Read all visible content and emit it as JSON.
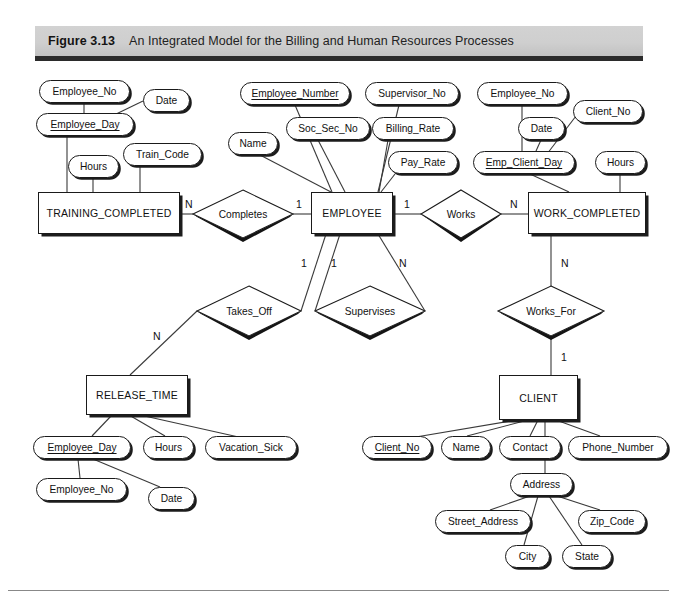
{
  "figure": {
    "number_label": "Figure 3.13",
    "title": "An Integrated Model for the Billing and Human Resources Processes"
  },
  "diagram": {
    "type": "entity-relationship-diagram",
    "entities": [
      {
        "id": "training_completed",
        "label": "TRAINING_COMPLETED",
        "x": 38,
        "y": 192,
        "w": 142,
        "h": 42
      },
      {
        "id": "employee",
        "label": "EMPLOYEE",
        "x": 311,
        "y": 192,
        "w": 82,
        "h": 42
      },
      {
        "id": "work_completed",
        "label": "WORK_COMPLETED",
        "x": 528,
        "y": 192,
        "w": 118,
        "h": 42
      },
      {
        "id": "release_time",
        "label": "RELEASE_TIME",
        "x": 86,
        "y": 375,
        "w": 102,
        "h": 40
      },
      {
        "id": "client",
        "label": "CLIENT",
        "x": 499,
        "y": 375,
        "w": 79,
        "h": 45
      }
    ],
    "relationships": [
      {
        "id": "completes",
        "label": "Completes",
        "cx": 243,
        "cy": 214,
        "rx": 50,
        "ry": 24
      },
      {
        "id": "works",
        "label": "Works",
        "cx": 461,
        "cy": 214,
        "rx": 40,
        "ry": 24
      },
      {
        "id": "takes_off",
        "label": "Takes_Off",
        "cx": 249,
        "cy": 311,
        "rx": 52,
        "ry": 25
      },
      {
        "id": "supervises",
        "label": "Supervises",
        "cx": 370,
        "cy": 311,
        "rx": 55,
        "ry": 25
      },
      {
        "id": "works_for",
        "label": "Works_For",
        "cx": 551,
        "cy": 311,
        "rx": 53,
        "ry": 25
      }
    ],
    "attributes": [
      {
        "id": "tc_employee_no",
        "label": "Employee_No",
        "key": false,
        "x": 39,
        "y": 80,
        "w": 91,
        "h": 23
      },
      {
        "id": "tc_date",
        "label": "Date",
        "key": false,
        "x": 143,
        "y": 89,
        "w": 47,
        "h": 23
      },
      {
        "id": "tc_employee_day",
        "label": "Employee_Day",
        "key": true,
        "x": 36,
        "y": 113,
        "w": 98,
        "h": 23
      },
      {
        "id": "tc_hours",
        "label": "Hours",
        "key": false,
        "x": 68,
        "y": 155,
        "w": 51,
        "h": 23
      },
      {
        "id": "tc_train_code",
        "label": "Train_Code",
        "key": false,
        "x": 123,
        "y": 143,
        "w": 79,
        "h": 23
      },
      {
        "id": "emp_employee_number",
        "label": "Employee_Number",
        "key": true,
        "x": 240,
        "y": 82,
        "w": 110,
        "h": 23
      },
      {
        "id": "emp_soc_sec_no",
        "label": "Soc_Sec_No",
        "key": false,
        "x": 286,
        "y": 117,
        "w": 84,
        "h": 23
      },
      {
        "id": "emp_name",
        "label": "Name",
        "key": false,
        "x": 228,
        "y": 132,
        "w": 50,
        "h": 23
      },
      {
        "id": "emp_supervisor_no",
        "label": "Supervisor_No",
        "key": false,
        "x": 365,
        "y": 82,
        "w": 94,
        "h": 23
      },
      {
        "id": "emp_billing_rate",
        "label": "Billing_Rate",
        "key": false,
        "x": 372,
        "y": 117,
        "w": 82,
        "h": 23
      },
      {
        "id": "emp_pay_rate",
        "label": "Pay_Rate",
        "key": false,
        "x": 388,
        "y": 151,
        "w": 70,
        "h": 23
      },
      {
        "id": "wc_employee_no",
        "label": "Employee_No",
        "key": false,
        "x": 477,
        "y": 82,
        "w": 91,
        "h": 23
      },
      {
        "id": "wc_date",
        "label": "Date",
        "key": false,
        "x": 518,
        "y": 117,
        "w": 47,
        "h": 23
      },
      {
        "id": "wc_client_no",
        "label": "Client_No",
        "key": false,
        "x": 573,
        "y": 100,
        "w": 70,
        "h": 23
      },
      {
        "id": "wc_emp_client_day",
        "label": "Emp_Client_Day",
        "key": true,
        "x": 473,
        "y": 151,
        "w": 102,
        "h": 23
      },
      {
        "id": "wc_hours",
        "label": "Hours",
        "key": false,
        "x": 595,
        "y": 151,
        "w": 51,
        "h": 23
      },
      {
        "id": "rt_employee_day",
        "label": "Employee_Day",
        "key": true,
        "x": 33,
        "y": 436,
        "w": 98,
        "h": 23
      },
      {
        "id": "rt_hours",
        "label": "Hours",
        "key": false,
        "x": 143,
        "y": 436,
        "w": 51,
        "h": 23
      },
      {
        "id": "rt_vacation_sick",
        "label": "Vacation_Sick",
        "key": false,
        "x": 205,
        "y": 436,
        "w": 92,
        "h": 23
      },
      {
        "id": "rt_employee_no",
        "label": "Employee_No",
        "key": false,
        "x": 36,
        "y": 478,
        "w": 91,
        "h": 23
      },
      {
        "id": "rt_date",
        "label": "Date",
        "key": false,
        "x": 148,
        "y": 487,
        "w": 47,
        "h": 23
      },
      {
        "id": "cl_client_no",
        "label": "Client_No",
        "key": true,
        "x": 362,
        "y": 436,
        "w": 70,
        "h": 23
      },
      {
        "id": "cl_name",
        "label": "Name",
        "key": false,
        "x": 441,
        "y": 436,
        "w": 50,
        "h": 23
      },
      {
        "id": "cl_contact",
        "label": "Contact",
        "key": false,
        "x": 499,
        "y": 436,
        "w": 62,
        "h": 23
      },
      {
        "id": "cl_phone_number",
        "label": "Phone_Number",
        "key": false,
        "x": 568,
        "y": 436,
        "w": 100,
        "h": 23
      },
      {
        "id": "cl_address",
        "label": "Address",
        "key": false,
        "x": 510,
        "y": 473,
        "w": 63,
        "h": 23
      },
      {
        "id": "cl_street_address",
        "label": "Street_Address",
        "key": false,
        "x": 435,
        "y": 510,
        "w": 96,
        "h": 23
      },
      {
        "id": "cl_zip_code",
        "label": "Zip_Code",
        "key": false,
        "x": 578,
        "y": 510,
        "w": 68,
        "h": 23
      },
      {
        "id": "cl_city",
        "label": "City",
        "key": false,
        "x": 505,
        "y": 545,
        "w": 45,
        "h": 23
      },
      {
        "id": "cl_state",
        "label": "State",
        "key": false,
        "x": 562,
        "y": 545,
        "w": 50,
        "h": 23
      }
    ],
    "cardinalities": [
      {
        "id": "card-tc-completes",
        "value": "N",
        "x": 185,
        "y": 198
      },
      {
        "id": "card-completes-emp",
        "value": "1",
        "x": 296,
        "y": 198
      },
      {
        "id": "card-emp-works",
        "value": "1",
        "x": 404,
        "y": 198
      },
      {
        "id": "card-works-wc",
        "value": "N",
        "x": 510,
        "y": 198
      },
      {
        "id": "card-emp-takesoff",
        "value": "1",
        "x": 301,
        "y": 257
      },
      {
        "id": "card-emp-supervises-1",
        "value": "1",
        "x": 331,
        "y": 257
      },
      {
        "id": "card-emp-supervises-n",
        "value": "N",
        "x": 399,
        "y": 257
      },
      {
        "id": "card-takesoff-rt",
        "value": "N",
        "x": 153,
        "y": 330
      },
      {
        "id": "card-wc-worksfor",
        "value": "N",
        "x": 561,
        "y": 257
      },
      {
        "id": "card-worksfor-client",
        "value": "1",
        "x": 561,
        "y": 351
      }
    ],
    "edges": [
      {
        "id": "e-tc-empno-empday",
        "points": "84,103 84,113"
      },
      {
        "id": "e-tc-date-empday",
        "points": "143,101 112,116"
      },
      {
        "id": "e-tc-empday-entity",
        "points": "67,136 67,192"
      },
      {
        "id": "e-tc-hours-entity",
        "points": "93,178 93,192"
      },
      {
        "id": "e-tc-traincode-entity",
        "points": "140,166 140,192"
      },
      {
        "id": "e-emp-empnum",
        "points": "295,105 332,192"
      },
      {
        "id": "e-emp-socsec",
        "points": "318,140 345,192"
      },
      {
        "id": "e-emp-name",
        "points": "260,155 331,192"
      },
      {
        "id": "e-emp-supno",
        "points": "399,105 378,192"
      },
      {
        "id": "e-emp-billrate",
        "points": "388,140 379,192"
      },
      {
        "id": "e-emp-payrate",
        "points": "395,174 381,192"
      },
      {
        "id": "e-wc-empno-ecd",
        "points": "522,105 522,151"
      },
      {
        "id": "e-wc-date-ecd",
        "points": "541,140 536,151"
      },
      {
        "id": "e-wc-clientno-ecd",
        "points": "576,116 547,154"
      },
      {
        "id": "e-wc-ecd-entity",
        "points": "530,174 569,192"
      },
      {
        "id": "e-wc-hours-entity",
        "points": "620,174 620,192"
      },
      {
        "id": "e-tc-completes",
        "points": "180,214 193,214"
      },
      {
        "id": "e-completes-emp",
        "points": "293,214 311,214"
      },
      {
        "id": "e-emp-works",
        "points": "393,214 421,214"
      },
      {
        "id": "e-works-wc",
        "points": "501,214 528,214"
      },
      {
        "id": "e-emp-takesoff",
        "points": "326,234 301,311"
      },
      {
        "id": "e-emp-supervises-1",
        "points": "340,234 315,311"
      },
      {
        "id": "e-emp-supervises-n",
        "points": "378,234 425,311"
      },
      {
        "id": "e-takesoff-rt",
        "points": "197,311 130,375"
      },
      {
        "id": "e-wc-worksfor",
        "points": "551,234 551,286"
      },
      {
        "id": "e-worksfor-client",
        "points": "551,336 551,375"
      },
      {
        "id": "e-rt-empday",
        "points": "112,415 92,436"
      },
      {
        "id": "e-rt-hours",
        "points": "129,415 165,436"
      },
      {
        "id": "e-rt-vacsick",
        "points": "140,415 243,438"
      },
      {
        "id": "e-rt-empday-empno",
        "points": "78,459 80,478"
      },
      {
        "id": "e-rt-empday-date",
        "points": "93,459 160,487"
      },
      {
        "id": "e-cl-clientno",
        "points": "517,420 410,438"
      },
      {
        "id": "e-cl-name",
        "points": "528,420 467,436"
      },
      {
        "id": "e-cl-contact",
        "points": "538,420 530,436"
      },
      {
        "id": "e-cl-phone",
        "points": "556,420 600,436"
      },
      {
        "id": "e-cl-address",
        "points": "545,420 545,473"
      },
      {
        "id": "e-addr-street",
        "points": "530,496 490,510"
      },
      {
        "id": "e-addr-city",
        "points": "538,496 524,545"
      },
      {
        "id": "e-addr-state",
        "points": "549,496 582,545"
      },
      {
        "id": "e-addr-zip",
        "points": "557,496 600,510"
      }
    ]
  }
}
